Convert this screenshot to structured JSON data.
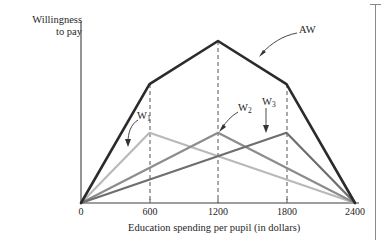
{
  "figure": {
    "name": "willingness-to-pay-vs-education-spending",
    "y_axis_title": "Willingness\nto pay",
    "x_axis_title": "Education spending per pupil (in dollars)"
  },
  "chart_data": {
    "type": "line",
    "title": "",
    "xlabel": "Education spending per pupil (in dollars)",
    "ylabel": "Willingness to pay",
    "xlim": [
      0,
      2400
    ],
    "ylim": [
      0,
      100
    ],
    "grid": "dashed vertical gridlines at 600, 1200, 1800",
    "legend": "inline labels with arrows",
    "xticks": [
      0,
      600,
      1200,
      1800,
      2400
    ],
    "xtick_labels": [
      "0",
      "600",
      "1200",
      "1800",
      "2400"
    ],
    "yticks": [],
    "ytick_labels": [],
    "series": [
      {
        "name": "AW",
        "label": "AW",
        "color": "#2b2b2b",
        "width": 2.6,
        "peak_x": 1200,
        "x": [
          0,
          600,
          1200,
          1800,
          2400
        ],
        "values": [
          0,
          66,
          90,
          66,
          0
        ]
      },
      {
        "name": "W1",
        "label": "W₁",
        "color": "#b9b9b9",
        "width": 2.2,
        "peak_x": 600,
        "x": [
          0,
          600,
          2400
        ],
        "values": [
          0,
          39,
          0
        ]
      },
      {
        "name": "W2",
        "label": "W₂",
        "color": "#8c8c8c",
        "width": 2.2,
        "peak_x": 1200,
        "x": [
          0,
          1200,
          2400
        ],
        "values": [
          0,
          39,
          0
        ]
      },
      {
        "name": "W3",
        "label": "W₃",
        "color": "#6e6e6e",
        "width": 2.2,
        "peak_x": 1800,
        "x": [
          0,
          1800,
          2400
        ],
        "values": [
          0,
          39,
          0
        ]
      }
    ],
    "annotations": [
      {
        "text": "AW",
        "target_series": "AW",
        "points_to_x": 1500
      },
      {
        "text": "W1",
        "target_series": "W1",
        "points_to_x": 480
      },
      {
        "text": "W2",
        "target_series": "W2",
        "points_to_x": 1200
      },
      {
        "text": "W3",
        "target_series": "W3",
        "points_to_x": 1620
      }
    ]
  },
  "labels": {
    "aw": "AW",
    "w1_base": "W",
    "w1_sub": "1",
    "w2_base": "W",
    "w2_sub": "2",
    "w3_base": "W",
    "w3_sub": "3"
  },
  "ticks": {
    "t0": "0",
    "t600": "600",
    "t1200": "1200",
    "t1800": "1800",
    "t2400": "2400"
  },
  "colors": {
    "axis": "#3d3d3d",
    "aw": "#2b2b2b",
    "w1": "#b9b9b9",
    "w2": "#8c8c8c",
    "w3": "#6e6e6e",
    "gridline": "#555555",
    "margin_rule": "#8a8a8a"
  }
}
